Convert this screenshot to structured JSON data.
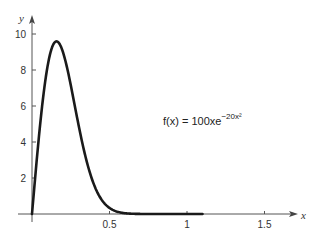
{
  "chart_data": {
    "type": "line",
    "title": "",
    "xlabel": "x",
    "ylabel": "y",
    "annotation": {
      "prefix": "f(x) = 100xe",
      "exponent": "−20x²",
      "full": "f(x) = 100xe^(-20x^2)"
    },
    "x_ticks": [
      0.5,
      1,
      1.5
    ],
    "x_tick_labels": [
      "0.5",
      "1",
      "1.5"
    ],
    "y_ticks": [
      2,
      4,
      6,
      8,
      10
    ],
    "y_tick_labels": [
      "2",
      "4",
      "6",
      "8",
      "10"
    ],
    "xlim": [
      0,
      1.8
    ],
    "ylim": [
      0,
      11
    ],
    "grid": false,
    "legend": "none",
    "series": [
      {
        "name": "f(x) = 100xe^(-20x^2)",
        "x": [
          0,
          0.02,
          0.05,
          0.08,
          0.1,
          0.12,
          0.158,
          0.2,
          0.25,
          0.3,
          0.35,
          0.4,
          0.45,
          0.5,
          0.6,
          0.7,
          0.8,
          0.9,
          1.0,
          1.1
        ],
        "values": [
          0,
          1.98,
          4.76,
          7.0,
          8.19,
          8.99,
          9.53,
          8.99,
          7.16,
          4.96,
          2.94,
          1.61,
          0.78,
          0.34,
          0.05,
          0.0,
          0.0,
          0.0,
          0.0,
          0.0
        ]
      }
    ],
    "curve_end_x": 1.1
  }
}
